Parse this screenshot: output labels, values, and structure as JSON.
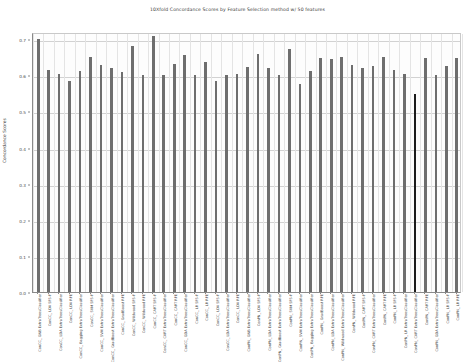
{
  "chart_data": {
    "type": "bar",
    "title": "10Xfold Concordance Scores by Feature Selection method w/ 50 features",
    "xlabel": "",
    "ylabel": "Concordance Scores",
    "ylim": [
      0.0,
      0.72
    ],
    "yticks": [
      "0.0",
      "0.1",
      "0.2",
      "0.3",
      "0.4",
      "0.5",
      "0.6",
      "0.7"
    ],
    "ytick_values": [
      0.0,
      0.1,
      0.2,
      0.3,
      0.4,
      0.5,
      0.6,
      0.7
    ],
    "grid": true,
    "legend": "none",
    "bar_color": "#6e6e6e",
    "highlight_color": "#1c1c1c",
    "categories": [
      "ConCC_ GNB ExtraTreesClassifier",
      "ConCC_ LDA SFS-F",
      "ConCC_ LDA ExtraTreesClassifier",
      "ConCC_ LDA RFE",
      "ConCC_ Bagging ExtraTreesClassifier",
      "ConCC_ SVM SFS-F",
      "ConCC_ SVM ExtraTreesClassifier",
      "ConCC_ GradBoost ExtraTreesClassifier",
      "ConCC_ GradBoost RFE",
      "ConCC_ Wildwood SFS-F",
      "ConCC_ Wildwood RFE",
      "ConCC_ CART SFS-F",
      "ConCC_ CART ExtraTreesClassifier",
      "ConCC_ CART RFE",
      "ConCC_ GDA ExtraTreesClassifier",
      "ConCC_ LR SFS-F",
      "ConCC_ LR RFE",
      "ConCC_ LDA SFS-F",
      "ConCC_ LDA ExtraTreesClassifier",
      "ConCC_ LDA RFE",
      "ConPN_ GNB ExtraTreesClassifier",
      "ConPN_ LDA SFS-F",
      "ConPN_ LDA ExtraTreesClassifier",
      "ConPN_ GradBoost ExtraTreesClassifier",
      "ConPN_ SVM SFS-F",
      "ConPN_ SVM ExtraTreesClassifier",
      "ConPN_ Bagging ExtraTreesClassifier",
      "ConPN_ GradBoost RFE",
      "ConPN_ LDA ExtraTreesClassifier",
      "ConPN_ Wildwood ExtraTreesClassifier",
      "ConPN_ Wildwood RFE",
      "ConPN_ CART SFS-F",
      "ConPN_ CART ExtraTreesClassifier",
      "ConPN_ CART RFE",
      "ConPN_ LR SFS-F",
      "ConPN_ LR ExtraTreesClassifier",
      "ConPN_ CART ExtraTreesClassifier",
      "ConPN_ CART RFE",
      "ConPN_ GDA ExtraTreesClassifier",
      "ConPN_ LR SFS-F",
      "ConPN_ LR RFE"
    ],
    "values": [
      0.7,
      0.615,
      0.605,
      0.585,
      0.612,
      0.65,
      0.628,
      0.62,
      0.608,
      0.68,
      0.6,
      0.71,
      0.6,
      0.632,
      0.655,
      0.6,
      0.638,
      0.585,
      0.6,
      0.605,
      0.622,
      0.66,
      0.62,
      0.6,
      0.672,
      0.575,
      0.612,
      0.648,
      0.645,
      0.652,
      0.63,
      0.62,
      0.625,
      0.65,
      0.615,
      0.605,
      0.548,
      0.648,
      0.6,
      0.625,
      0.648
    ],
    "highlight_index": 36
  }
}
